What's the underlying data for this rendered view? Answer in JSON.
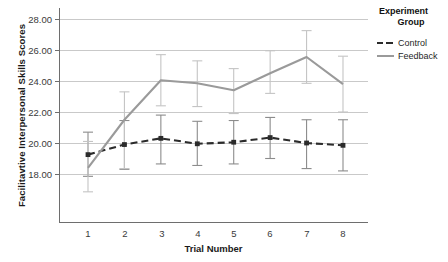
{
  "chart_data": {
    "type": "line",
    "title": "",
    "xlabel": "Trial Number",
    "ylabel": "Facilitavtive Interpersonal Skills Scores",
    "categories": [
      "1",
      "2",
      "3",
      "4",
      "5",
      "6",
      "7",
      "8"
    ],
    "x": [
      1,
      2,
      3,
      4,
      5,
      6,
      7,
      8
    ],
    "ylim": [
      16.5,
      28.6
    ],
    "yticks": [
      "18.00",
      "20.00",
      "22.00",
      "24.00",
      "26.00",
      "28.00"
    ],
    "ytick_values": [
      18,
      20,
      22,
      24,
      26,
      28
    ],
    "grid": "horizontal",
    "legend_position": "right",
    "legend_title_line1": "Experiment",
    "legend_title_line2": "Group",
    "series": [
      {
        "name": "Control",
        "color": "#2b2b2b",
        "style": "dashed",
        "marker": "square",
        "values": [
          19.25,
          19.9,
          20.3,
          19.95,
          20.05,
          20.35,
          20.0,
          19.85
        ],
        "err_low": [
          17.85,
          18.3,
          18.65,
          18.55,
          18.65,
          19.0,
          18.35,
          18.2
        ],
        "err_high": [
          20.7,
          21.45,
          21.8,
          21.4,
          21.45,
          21.65,
          21.5,
          21.5
        ]
      },
      {
        "name": "Feedback",
        "color": "#9a9a9a",
        "style": "solid",
        "marker": "none",
        "values": [
          18.4,
          21.5,
          24.05,
          23.85,
          23.4,
          24.5,
          25.55,
          23.8
        ],
        "err_low": [
          16.85,
          18.35,
          22.4,
          22.35,
          21.9,
          23.2,
          23.85,
          22.0
        ],
        "err_high": [
          20.1,
          23.3,
          25.7,
          25.3,
          24.8,
          25.95,
          27.25,
          25.6
        ]
      }
    ]
  },
  "legend": {
    "title_line1": "Experiment",
    "title_line2": "Group",
    "items": [
      {
        "label": "Control"
      },
      {
        "label": "Feedback"
      }
    ]
  },
  "axes": {
    "y_label": "Facilitavtive Interpersonal Skills Scores",
    "x_label": "Trial Number",
    "y_ticks": [
      "28.00",
      "26.00",
      "24.00",
      "22.00",
      "20.00",
      "18.00"
    ],
    "x_ticks": [
      "1",
      "2",
      "3",
      "4",
      "5",
      "6",
      "7",
      "8"
    ]
  },
  "colors": {
    "control": "#2b2b2b",
    "feedback": "#9a9a9a",
    "grid": "#c9c9c9",
    "axis": "#6e6e6e",
    "text": "#1f1f1f"
  }
}
